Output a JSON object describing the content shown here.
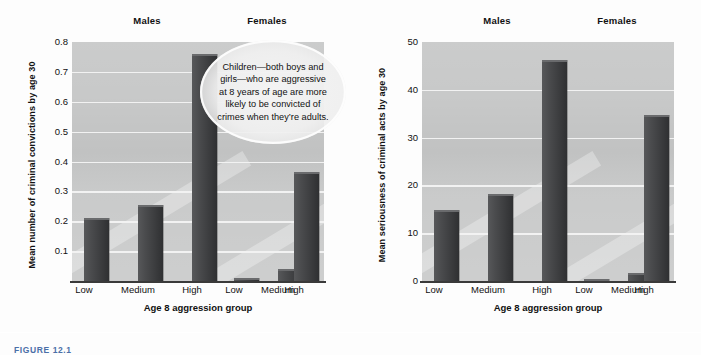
{
  "figure": {
    "caption": "FIGURE 12.1"
  },
  "panels": [
    {
      "id": "convictions",
      "group_labels": {
        "males": "Males",
        "females": "Females"
      },
      "ytitle": "Mean number of criminal convictions by age 30",
      "xtitle": "Age 8 aggression group",
      "yticks": [
        "0.8",
        "0.7",
        "0.6",
        "0.5",
        "0.4",
        "0.3",
        "0.2",
        "0.1"
      ],
      "xticks": [
        "Low",
        "Medium",
        "High",
        "Low",
        "Medium",
        "High"
      ],
      "callout": "Children—both boys  and girls—who are aggressive at 8 years of age are more likely to be convicted of crimes when they’re adults."
    },
    {
      "id": "seriousness",
      "group_labels": {
        "males": "Males",
        "females": "Females"
      },
      "ytitle": "Mean seriousness of criminal acts by age 30",
      "xtitle": "Age 8 aggression group",
      "yticks": [
        "50",
        "40",
        "30",
        "20",
        "10",
        "0"
      ],
      "xticks": [
        "Low",
        "Medium",
        "High",
        "Low",
        "Medium",
        "High"
      ],
      "callout": "Aggressive boys and girls also commit more serious crimes by the time they reach adulthood."
    }
  ],
  "colors": {
    "bar": "#434446",
    "plot_background": "#c8c9c9",
    "gridline": "#f2f2f2",
    "axis": "#3a3a3a",
    "caption": "#4b6fa8"
  },
  "chart_data": [
    {
      "type": "bar",
      "title": "Mean number of criminal convictions by age 30",
      "xlabel": "Age 8 aggression group",
      "ylabel": "Mean number of criminal convictions by age 30",
      "categories": [
        "Low",
        "Medium",
        "High",
        "Low",
        "Medium",
        "High"
      ],
      "group_labels": [
        "Males",
        "Males",
        "Males",
        "Females",
        "Females",
        "Females"
      ],
      "values": [
        0.21,
        0.255,
        0.76,
        0.01,
        0.04,
        0.365
      ],
      "ylim": [
        0,
        0.8
      ],
      "yticks": [
        0.1,
        0.2,
        0.3,
        0.4,
        0.5,
        0.6,
        0.7,
        0.8
      ],
      "grid": true,
      "legend": "none"
    },
    {
      "type": "bar",
      "title": "Mean seriousness of criminal acts by age 30",
      "xlabel": "Age 8 aggression group",
      "ylabel": "Mean seriousness of criminal acts by age 30",
      "categories": [
        "Low",
        "Medium",
        "High",
        "Low",
        "Medium",
        "High"
      ],
      "group_labels": [
        "Males",
        "Males",
        "Males",
        "Females",
        "Females",
        "Females"
      ],
      "values": [
        14.8,
        18.3,
        46.3,
        0.5,
        1.6,
        34.7
      ],
      "ylim": [
        0,
        50
      ],
      "yticks": [
        0,
        10,
        20,
        30,
        40,
        50
      ],
      "grid": true,
      "legend": "none"
    }
  ]
}
